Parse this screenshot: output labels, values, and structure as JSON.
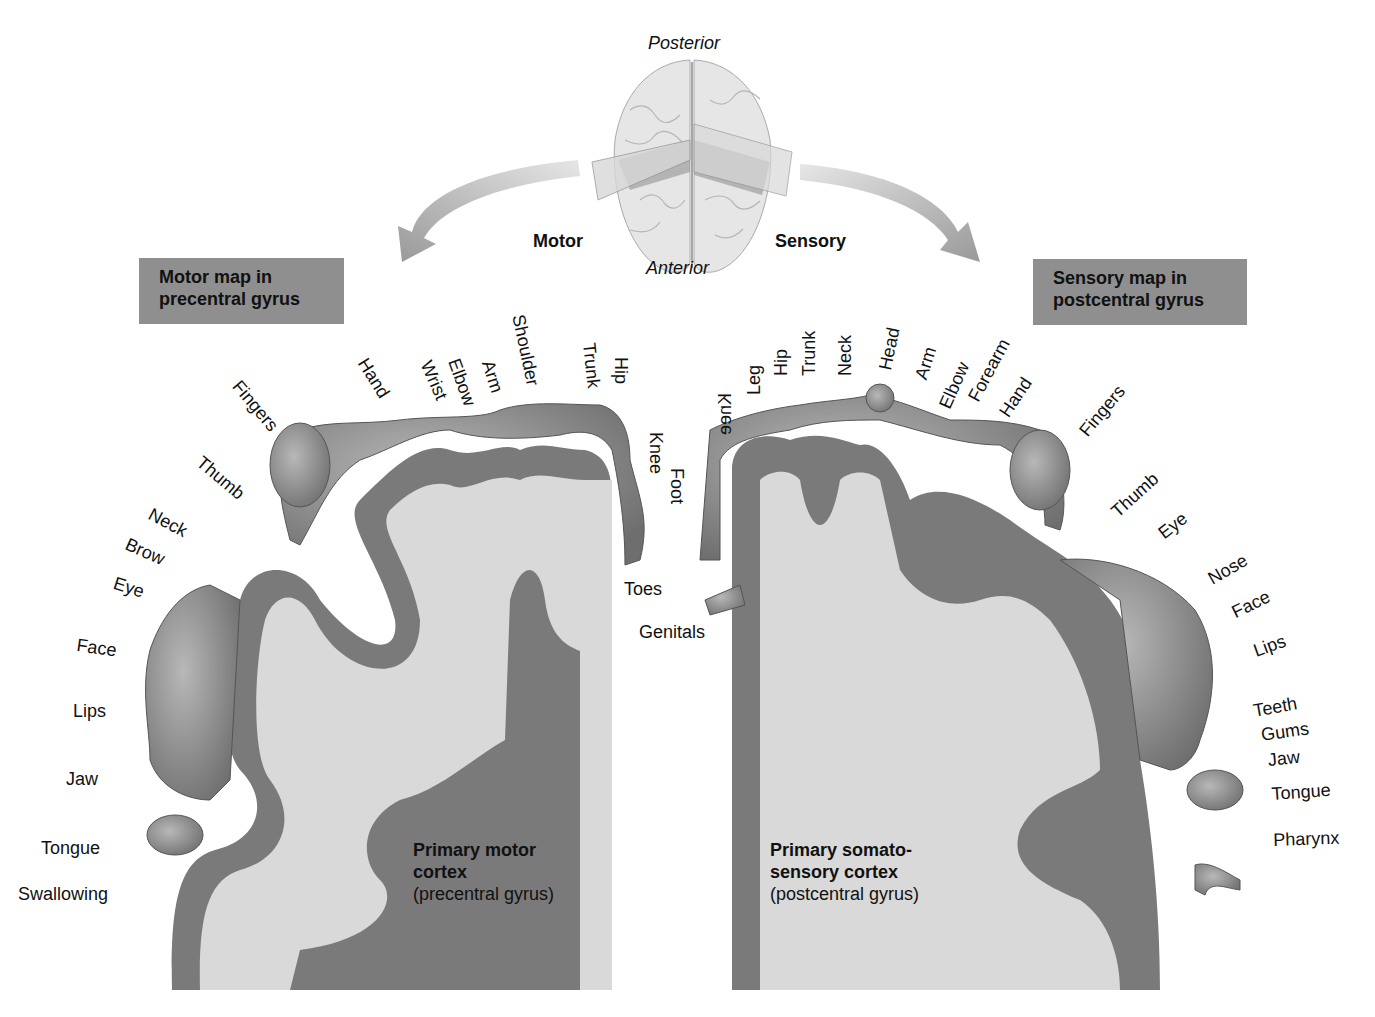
{
  "orientation": {
    "top": "Posterior",
    "bottom": "Anterior",
    "left_arrow_label": "Motor",
    "right_arrow_label": "Sensory"
  },
  "motor": {
    "map_title_line1": "Motor map in",
    "map_title_line2": "precentral gyrus",
    "cortex_title_line1": "Primary motor",
    "cortex_title_line2": "cortex",
    "cortex_subtitle": "(precentral gyrus)",
    "labels": [
      {
        "text": "Toes"
      },
      {
        "text": "Knee"
      },
      {
        "text": "Hip"
      },
      {
        "text": "Trunk"
      },
      {
        "text": "Shoulder"
      },
      {
        "text": "Arm"
      },
      {
        "text": "Elbow"
      },
      {
        "text": "Wrist"
      },
      {
        "text": "Hand"
      },
      {
        "text": "Fingers"
      },
      {
        "text": "Thumb"
      },
      {
        "text": "Neck"
      },
      {
        "text": "Brow"
      },
      {
        "text": "Eye"
      },
      {
        "text": "Face"
      },
      {
        "text": "Lips"
      },
      {
        "text": "Jaw"
      },
      {
        "text": "Tongue"
      },
      {
        "text": "Swallowing"
      }
    ]
  },
  "sensory": {
    "map_title_line1": "Sensory map in",
    "map_title_line2": "postcentral gyrus",
    "cortex_title_line1": "Primary somato-",
    "cortex_title_line2": "sensory cortex",
    "cortex_subtitle": "(postcentral gyrus)",
    "labels": [
      {
        "text": "Genitals"
      },
      {
        "text": "Foot"
      },
      {
        "text": "Knee"
      },
      {
        "text": "Leg"
      },
      {
        "text": "Hip"
      },
      {
        "text": "Trunk"
      },
      {
        "text": "Neck"
      },
      {
        "text": "Head"
      },
      {
        "text": "Arm"
      },
      {
        "text": "Elbow"
      },
      {
        "text": "Forearm"
      },
      {
        "text": "Hand"
      },
      {
        "text": "Fingers"
      },
      {
        "text": "Thumb"
      },
      {
        "text": "Eye"
      },
      {
        "text": "Nose"
      },
      {
        "text": "Face"
      },
      {
        "text": "Lips"
      },
      {
        "text": "Teeth"
      },
      {
        "text": "Gums"
      },
      {
        "text": "Jaw"
      },
      {
        "text": "Tongue"
      },
      {
        "text": "Pharynx"
      }
    ]
  },
  "colors": {
    "map_box": "#8f8f8f",
    "white_matter": "#d9d9d9",
    "gray_matter": "#7a7a7a",
    "homunculus": "#9a9a9a",
    "arrow": "#a0a0a0"
  }
}
